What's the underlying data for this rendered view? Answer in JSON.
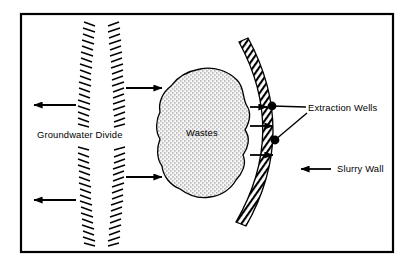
{
  "figure": {
    "name": "groundwater-containment-diagram",
    "background_color": "#ffffff",
    "ink_color": "#000000",
    "frame": {
      "name": "diagram-border",
      "x": 21,
      "y": 14,
      "width": 372,
      "height": 238,
      "stroke_width": 2.2
    }
  },
  "labels": {
    "groundwater_divide": "Groundwater Divide",
    "wastes": "Wastes",
    "extraction_wells": "Extraction Wells",
    "slurry_wall": "Slurry Wall"
  },
  "features": {
    "groundwater_divide": {
      "name": "groundwater-divide",
      "description": "two vertical hatched bands",
      "band_left_x": 82,
      "band_right_x": 118,
      "band_top": 22,
      "band_bottom": 246,
      "gap_top": 124,
      "gap_bottom": 146
    },
    "waste_mass": {
      "name": "waste-mass",
      "fill_pattern": "stipple",
      "center_x": 205,
      "center_y": 132
    },
    "slurry_wall": {
      "name": "slurry-wall",
      "shape": "arc-bowed-right",
      "fill_pattern": "diagonal-hatch",
      "top_end": [
        248,
        38
      ],
      "bottom_end": [
        246,
        226
      ],
      "apex_x": 297
    },
    "extraction_wells": {
      "name": "extraction-wells",
      "count": 2,
      "points": [
        [
          272,
          106
        ],
        [
          275,
          140
        ]
      ],
      "radius": 4.4
    }
  },
  "flow_arrows": {
    "left_outflow": [
      {
        "name": "flow-arrow-left-upper",
        "x1": 76,
        "y1": 105,
        "x2": 33,
        "y2": 105
      },
      {
        "name": "flow-arrow-left-lower",
        "x1": 76,
        "y1": 200,
        "x2": 33,
        "y2": 200
      }
    ],
    "right_inflow": [
      {
        "name": "flow-arrow-right-upper",
        "x1": 123,
        "y1": 88,
        "x2": 163,
        "y2": 88
      },
      {
        "name": "flow-arrow-right-lower",
        "x1": 123,
        "y1": 177,
        "x2": 163,
        "y2": 177
      }
    ],
    "toward_wall": [
      {
        "name": "flow-arrow-wall-upper",
        "x1": 250,
        "y1": 107,
        "x2": 276,
        "y2": 107
      },
      {
        "name": "flow-arrow-wall-middle",
        "x1": 250,
        "y1": 126,
        "x2": 276,
        "y2": 126
      },
      {
        "name": "flow-arrow-wall-lower",
        "x1": 250,
        "y1": 155,
        "x2": 276,
        "y2": 155
      }
    ]
  },
  "leaders": {
    "extraction_wells_upper": {
      "name": "leader-extraction-wells-upper",
      "from": [
        272,
        106
      ],
      "to": [
        303,
        107
      ]
    },
    "extraction_wells_lower": {
      "name": "leader-extraction-wells-lower",
      "from": [
        275,
        140
      ],
      "to": [
        305,
        113
      ]
    },
    "slurry_wall_arrow": {
      "name": "leader-slurry-wall",
      "x1": 330,
      "y1": 169,
      "x2": 300,
      "y2": 169
    }
  },
  "text_positions": {
    "groundwater_divide": {
      "x": 37,
      "y": 138
    },
    "wastes": {
      "x": 186,
      "y": 136
    },
    "extraction_wells": {
      "x": 308,
      "y": 111
    },
    "slurry_wall": {
      "x": 336,
      "y": 172
    }
  }
}
